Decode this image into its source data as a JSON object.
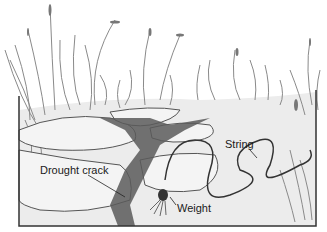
{
  "figure": {
    "labels": {
      "drought_crack": "Drought crack",
      "string": "String",
      "weight": "Weight"
    },
    "colors": {
      "line": "#2a2a2a",
      "grass": "#8a8a8a",
      "ground": "#e6e6e6",
      "crack": "#5a5a5a"
    }
  }
}
